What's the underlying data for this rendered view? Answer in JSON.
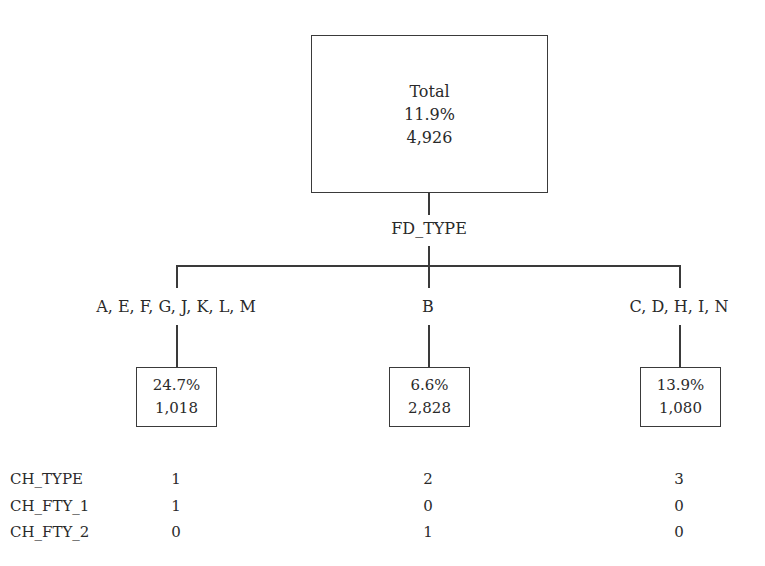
{
  "root": {
    "title": "Total",
    "percent": "11.9%",
    "count": "4,926"
  },
  "split_variable": "FD_TYPE",
  "branches": [
    {
      "label": "A, E, F, G, J, K, L, M",
      "percent": "24.7%",
      "count": "1,018"
    },
    {
      "label": "B",
      "percent": "6.6%",
      "count": "2,828"
    },
    {
      "label": "C, D, H, I, N",
      "percent": "13.9%",
      "count": "1,080"
    }
  ],
  "coding_table": {
    "rows": [
      {
        "name": "CH_TYPE",
        "values": [
          "1",
          "2",
          "3"
        ]
      },
      {
        "name": "CH_FTY_1",
        "values": [
          "1",
          "0",
          "0"
        ]
      },
      {
        "name": "CH_FTY_2",
        "values": [
          "0",
          "1",
          "0"
        ]
      }
    ]
  }
}
